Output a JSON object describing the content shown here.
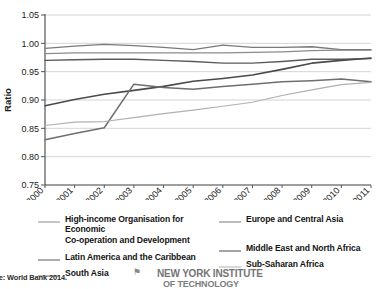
{
  "chart_data": {
    "type": "line",
    "title": "",
    "xlabel": "",
    "ylabel": "Ratio",
    "x": [
      2000,
      2001,
      2002,
      2003,
      2004,
      2005,
      2006,
      2007,
      2008,
      2009,
      2010,
      2011
    ],
    "xtick_labels": [
      "2000",
      "2001",
      "2002",
      "2003",
      "2004",
      "2005",
      "2006",
      "2007",
      "2008",
      "2009",
      "2010",
      "2011"
    ],
    "ytick_labels": [
      "0.75",
      "0.80",
      "0.85",
      "0.90",
      "0.95",
      "1.00",
      "1.05"
    ],
    "yticks": [
      0.75,
      0.8,
      0.85,
      0.9,
      0.95,
      1.0,
      1.05
    ],
    "ylim": [
      0.75,
      1.05
    ],
    "xlim": [
      2000,
      2011
    ],
    "grid": true,
    "legend_position": "below",
    "series": [
      {
        "name": "High-income Organisation for Economic Co-operation and Development",
        "color": "#8c8c8c",
        "width": 1.3,
        "values": [
          0.982,
          0.983,
          0.983,
          0.983,
          0.983,
          0.983,
          0.983,
          0.984,
          0.985,
          0.987,
          0.988,
          0.988
        ]
      },
      {
        "name": "Europe and Central Asia",
        "color": "#7a7a7a",
        "width": 1.3,
        "values": [
          0.991,
          0.995,
          0.998,
          0.996,
          0.993,
          0.989,
          0.997,
          0.993,
          0.993,
          0.994,
          0.989,
          0.989
        ]
      },
      {
        "name": "Latin America and the Caribbean",
        "color": "#5a5a5a",
        "width": 1.4,
        "values": [
          0.97,
          0.971,
          0.972,
          0.972,
          0.97,
          0.968,
          0.965,
          0.965,
          0.968,
          0.972,
          0.972,
          0.973
        ]
      },
      {
        "name": "Middle East and North Africa",
        "color": "#4a4a4a",
        "width": 1.6,
        "values": [
          0.89,
          0.901,
          0.91,
          0.917,
          0.924,
          0.933,
          0.938,
          0.944,
          0.954,
          0.965,
          0.97,
          0.974
        ]
      },
      {
        "name": "South Asia",
        "color": "#6e6e6e",
        "width": 1.5,
        "values": [
          0.83,
          0.841,
          0.851,
          0.928,
          0.922,
          0.919,
          0.924,
          0.928,
          0.932,
          0.934,
          0.937,
          0.932
        ]
      },
      {
        "name": "Sub-Saharan Africa",
        "color": "#b0b0b0",
        "width": 1.2,
        "values": [
          0.855,
          0.861,
          0.862,
          0.869,
          0.876,
          0.882,
          0.889,
          0.896,
          0.908,
          0.918,
          0.927,
          0.931
        ]
      }
    ]
  },
  "legend": {
    "entries": [
      {
        "label": "High-income Organisation for Economic\nCo-operation and Development",
        "color": "#8c8c8c",
        "width": 1.3
      },
      {
        "label": "Europe and Central Asia",
        "color": "#7a7a7a",
        "width": 1.3
      },
      {
        "label": "Latin America and the Caribbean",
        "color": "#5a5a5a",
        "width": 1.4
      },
      {
        "label": "Middle East and North Africa",
        "color": "#4a4a4a",
        "width": 1.8
      },
      {
        "label": "South Asia",
        "color": "#6e6e6e",
        "width": 1.5
      },
      {
        "label": "Sub-Saharan Africa",
        "color": "#b0b0b0",
        "width": 1.2
      }
    ]
  },
  "source_note": "rce: World Bank 2014.",
  "watermark": {
    "line1": "NEW YORK INSTITUTE",
    "line2": "OF TECHNOLOGY",
    "mark": "⚑"
  }
}
